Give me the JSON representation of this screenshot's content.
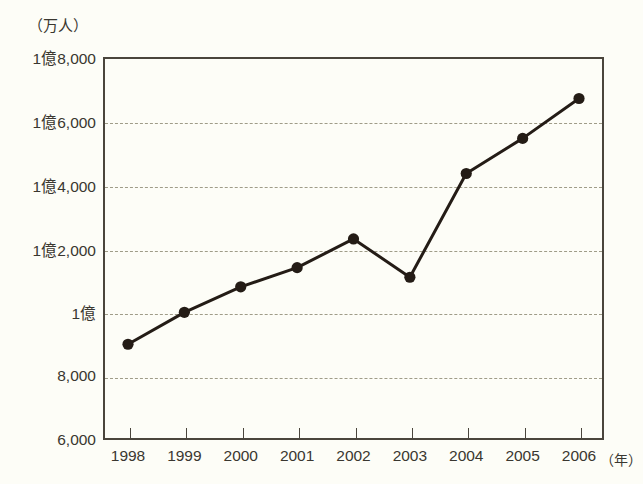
{
  "chart_data": {
    "type": "line",
    "title": "",
    "subtitle": "",
    "xlabel": "（年）",
    "ylabel": "（万人）",
    "categories": [
      "1998",
      "1999",
      "2000",
      "2001",
      "2002",
      "2003",
      "2004",
      "2005",
      "2006"
    ],
    "values": [
      9000,
      10000,
      10800,
      11400,
      12300,
      11100,
      14350,
      15450,
      16700
    ],
    "value_labels": [
      "9,000",
      "1億",
      "1億800",
      "1億1,400",
      "1億2,300",
      "1億1,100",
      "1億4,350",
      "1億5,450",
      "1億6,700"
    ],
    "series": [
      {
        "name": "",
        "values": [
          9000,
          10000,
          10800,
          11400,
          12300,
          11100,
          14350,
          15450,
          16700
        ]
      }
    ],
    "ylim": [
      6000,
      18000
    ],
    "ytick_values": [
      18000,
      16000,
      14000,
      12000,
      10000,
      8000,
      6000
    ],
    "ytick_labels": [
      "1億8,000",
      "1億6,000",
      "1億4,000",
      "1億2,000",
      "1億",
      "8,000",
      "6,000"
    ],
    "xtick_labels": [
      "1998",
      "1999",
      "2000",
      "2001",
      "2002",
      "2003",
      "2004",
      "2005",
      "2006"
    ],
    "grid": true,
    "gridlines_at": [
      16000,
      14000,
      12000,
      10000,
      8000
    ],
    "legend": [],
    "legend_position": "none",
    "annotations": [],
    "colors": {
      "line": "#241c16",
      "marker": "#241c16",
      "frame": "#4a453c",
      "grid": "#9a9783",
      "text": "#3a3730",
      "background": "#fdfdf7"
    }
  }
}
